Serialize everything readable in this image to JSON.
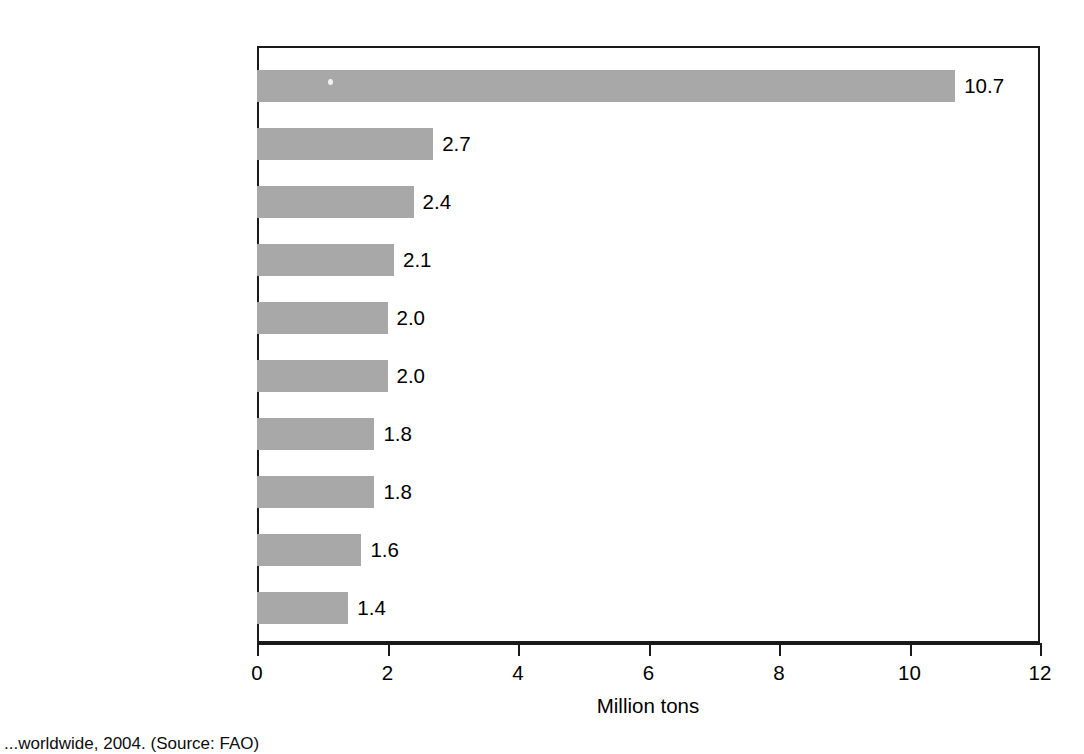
{
  "chart_data": {
    "type": "bar",
    "orientation": "horizontal",
    "title": "",
    "xlabel": "Million tons",
    "ylabel": "",
    "xlim": [
      0,
      12
    ],
    "xticks": [
      0,
      2,
      4,
      6,
      8,
      10,
      12
    ],
    "xtick_labels": [
      "0",
      "2",
      "4",
      "6",
      "8",
      "10",
      "12"
    ],
    "grid": false,
    "legend": null,
    "bar_color": "#a8a8a8",
    "frame_color": "#1a1a1a",
    "categories": [
      "Anchoveta",
      "Alaska pollock",
      "Blue whiting",
      "Skipjack tuna",
      "Atlantic herring",
      "Chub mackerel",
      "Japanese anchovy",
      "Chilean jack mackerel",
      "Largehead hairtail",
      "Yellowfin tuna"
    ],
    "values": [
      10.7,
      2.7,
      2.4,
      2.1,
      2.0,
      2.0,
      1.8,
      1.8,
      1.6,
      1.4
    ],
    "value_labels": [
      "10.7",
      "2.7",
      "2.4",
      "2.1",
      "2.0",
      "2.0",
      "1.8",
      "1.8",
      "1.6",
      "1.4"
    ]
  },
  "caption": {
    "text": "...worldwide, 2004. (Source: FAO)"
  }
}
